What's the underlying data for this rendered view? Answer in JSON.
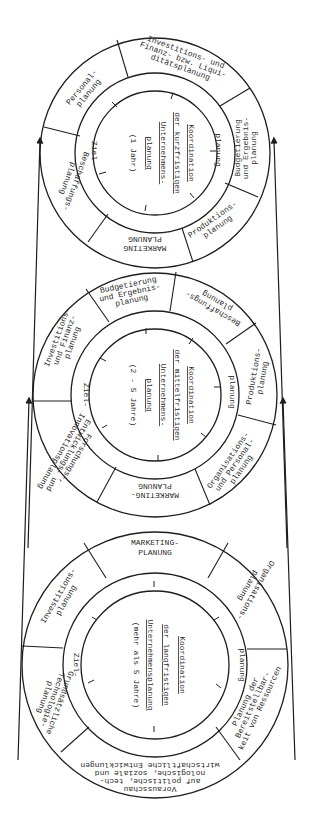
{
  "diagram": {
    "wheels": [
      {
        "id": "short-term",
        "center_text": [
          "Koordination",
          "der kurzfristigen",
          "Unternehmens-",
          "planung",
          "(1 Jahr)"
        ],
        "inner_ring": {
          "left": "Ziel-",
          "right": "planung"
        },
        "segments": [
          {
            "label": [
              "Investitions- und",
              "Finanz- bzw. Liqui-",
              "ditätsplanung"
            ]
          },
          {
            "label": [
              "Budgetierung",
              "und Ergebnis-",
              "planung"
            ]
          },
          {
            "label": [
              "Produktions-",
              "planung"
            ]
          },
          {
            "label": [
              "MARKETING",
              "PLANUNG"
            ]
          },
          {
            "label": [
              "Beschaffungs-",
              "planung"
            ]
          },
          {
            "label": [
              "Personal-",
              "planung"
            ]
          }
        ]
      },
      {
        "id": "mid-term",
        "center_text": [
          "Koordination",
          "der mittelfristigen",
          "Unternehmens-",
          "planung",
          "(2 - 5 Jahre)"
        ],
        "inner_ring": {
          "left": "Ziel-",
          "right": "planung"
        },
        "segments": [
          {
            "label": [
              "Budgetierung",
              "und Ergebnis-",
              "planung"
            ]
          },
          {
            "label": [
              "Beschaffungs-",
              "planung"
            ]
          },
          {
            "label": [
              "Produktions-",
              "planung"
            ]
          },
          {
            "label": [
              "Organisations-",
              "und Personal-",
              "planung"
            ]
          },
          {
            "label": [
              "MARKETING-",
              "PLANUNG"
            ]
          },
          {
            "label": [
              "Forschungs-,",
              "Entwicklungs- und",
              "Innovationsplanung"
            ]
          },
          {
            "label": [
              "Investitions-",
              "und Finanz-",
              "planung"
            ]
          }
        ]
      },
      {
        "id": "long-term",
        "center_text": [
          "Koordination",
          "der langfristigen",
          "Unternehmensplanung",
          "(mehr als 5 Jahre)"
        ],
        "inner_ring": {
          "left": "Ziel-",
          "right": "planung"
        },
        "segments": [
          {
            "label": [
              "MARKETING-",
              "PLANUNG"
            ]
          },
          {
            "label": [
              "Organisations-",
              "planung"
            ]
          },
          {
            "label": [
              "Planung der",
              "Bereitstellbar-",
              "keit von Ressourcen"
            ]
          },
          {
            "label": [
              "Vorausschau",
              "auf politische, tech-",
              "nologische, soziale und",
              "wirtschaftliche Entwicklungen"
            ]
          },
          {
            "label": [
              "Grundsätzliche",
              "Technologie-",
              "planung"
            ]
          },
          {
            "label": [
              "Investitions-",
              "planung"
            ]
          }
        ]
      }
    ]
  }
}
